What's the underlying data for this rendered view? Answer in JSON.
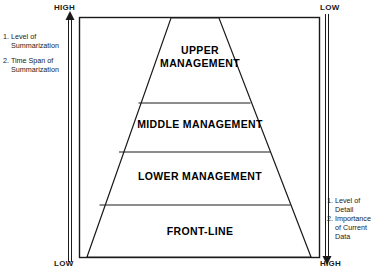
{
  "diagram": {
    "axes": {
      "left": {
        "top_label": "HIGH",
        "bottom_label": "LOW",
        "direction": "up",
        "notes": [
          {
            "number": "1.",
            "line1": "Level of",
            "line2": "Summarization"
          },
          {
            "number": "2.",
            "line1": "Time Span of",
            "line2": "Summarization"
          }
        ]
      },
      "right": {
        "top_label": "LOW",
        "bottom_label": "HIGH",
        "direction": "down",
        "notes": [
          {
            "number": "1.",
            "line1": "Level of",
            "line2": "Detail"
          },
          {
            "number": "2.",
            "line1": "Importance",
            "line2": "of Current",
            "line3": "Data"
          }
        ]
      }
    },
    "pyramid": {
      "bands": [
        {
          "label": "UPPER\nMANAGEMENT"
        },
        {
          "label": "MIDDLE MANAGEMENT"
        },
        {
          "label": "LOWER MANAGEMENT"
        },
        {
          "label": "FRONT-LINE"
        }
      ]
    },
    "colors": {
      "stroke": "#1a1a1a",
      "background": "#ffffff",
      "text": "#000000"
    }
  }
}
